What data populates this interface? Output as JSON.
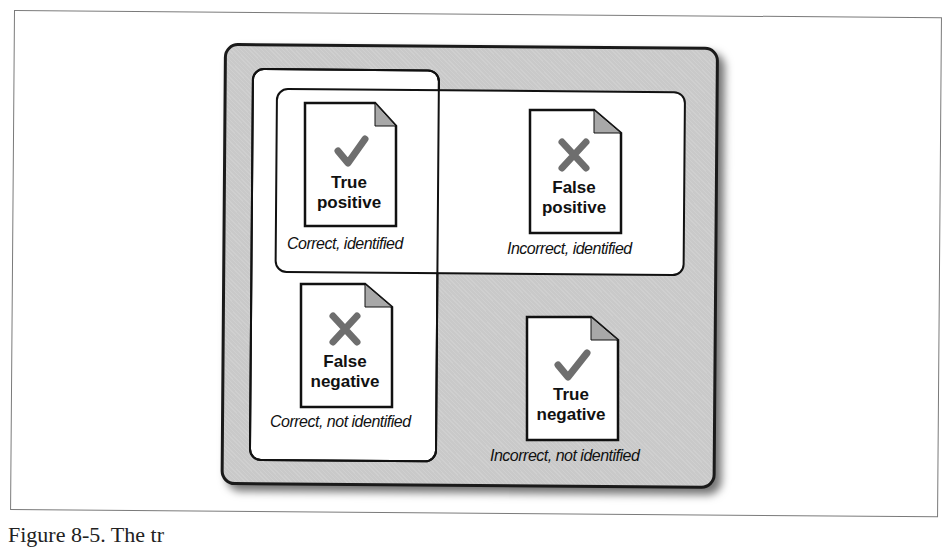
{
  "diagram": {
    "quadrants": [
      {
        "id": "tp",
        "title_line1": "True",
        "title_line2": "positive",
        "mark": "check",
        "caption": "Correct, identified"
      },
      {
        "id": "fp",
        "title_line1": "False",
        "title_line2": "positive",
        "mark": "cross",
        "caption": "Incorrect, identified"
      },
      {
        "id": "fn",
        "title_line1": "False",
        "title_line2": "negative",
        "mark": "cross",
        "caption": "Correct, not identified"
      },
      {
        "id": "tn",
        "title_line1": "True",
        "title_line2": "negative",
        "mark": "check",
        "caption": "Incorrect, not identified"
      }
    ],
    "groups": {
      "left_box": "Correct documents (True positive + False negative)",
      "top_box": "Identified documents (True positive + False positive)"
    },
    "colors": {
      "outer_bg": "#c9c9c9",
      "mark": "#6e6e6e",
      "fold": "#a8a8a8",
      "border": "#111111"
    }
  },
  "figure_caption": "Figure 8-5. The tr"
}
